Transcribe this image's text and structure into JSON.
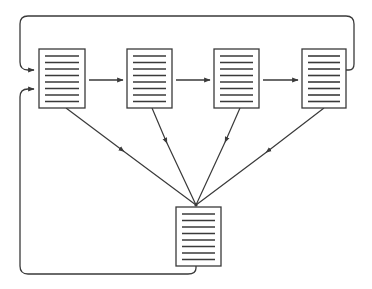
{
  "diagram": {
    "stroke_color": "#3a3a3a",
    "background": "#ffffff",
    "documents": [
      {
        "id": "doc-1",
        "x": 39,
        "y": 49,
        "w": 46,
        "h": 59,
        "lines": 8
      },
      {
        "id": "doc-2",
        "x": 127,
        "y": 49,
        "w": 45,
        "h": 59,
        "lines": 8
      },
      {
        "id": "doc-3",
        "x": 214,
        "y": 49,
        "w": 45,
        "h": 59,
        "lines": 8
      },
      {
        "id": "doc-4",
        "x": 302,
        "y": 49,
        "w": 44,
        "h": 59,
        "lines": 8
      },
      {
        "id": "doc-merged",
        "x": 176,
        "y": 207,
        "w": 45,
        "h": 59,
        "lines": 8
      }
    ],
    "sequence_arrows": [
      {
        "from": "doc-1",
        "to": "doc-2"
      },
      {
        "from": "doc-2",
        "to": "doc-3"
      },
      {
        "from": "doc-3",
        "to": "doc-4"
      }
    ],
    "merge_arrows": [
      {
        "from": "doc-1",
        "to": "doc-merged"
      },
      {
        "from": "doc-2",
        "to": "doc-merged"
      },
      {
        "from": "doc-3",
        "to": "doc-merged"
      },
      {
        "from": "doc-4",
        "to": "doc-merged"
      }
    ],
    "feedback_loops": [
      {
        "from": "doc-4",
        "to": "doc-1",
        "route": "top"
      },
      {
        "from": "doc-merged",
        "to": "doc-1",
        "route": "bottom-left"
      }
    ]
  }
}
